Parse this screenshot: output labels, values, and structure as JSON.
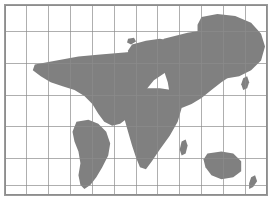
{
  "figure": {
    "width_px": 272,
    "height_px": 203
  },
  "chart_data": {
    "type": "map",
    "subtitle": "",
    "projection": "cylindrical",
    "xlabel": "Longitude",
    "ylabel": "Latitude",
    "xlim": [
      -180,
      180
    ],
    "ylim": [
      -60,
      84
    ],
    "grid": true,
    "legend_position": "none",
    "graticule": {
      "columns": 12,
      "rows": 6,
      "longitude_step_deg": 30,
      "latitude_step_deg": 24,
      "longitude_ticks": [
        -180,
        -150,
        -120,
        -90,
        -60,
        -30,
        0,
        30,
        60,
        90,
        120,
        150,
        180
      ],
      "latitude_ticks": [
        84,
        60,
        36,
        12,
        -12,
        -36,
        -60
      ]
    },
    "colors": {
      "land": "#808080",
      "ocean": "#ffffff",
      "graticule": "#8c8c8c",
      "border": "#9a9a9a",
      "background": "#ffffff"
    },
    "features": [
      "North America",
      "Greenland",
      "South America",
      "Europe",
      "Africa",
      "Asia",
      "Australia",
      "New Zealand",
      "Indonesia",
      "Japan",
      "British Isles",
      "Madagascar",
      "Iceland"
    ],
    "values": [],
    "categories": []
  },
  "map": {
    "land_color": "#808080",
    "ocean_color": "#ffffff",
    "grid_color": "#8c8c8c",
    "border_color": "#9a9a9a",
    "vertical_lines_x": [
      22,
      44,
      66,
      88,
      110,
      132,
      154,
      176,
      198,
      220,
      242
    ],
    "horizontal_lines_y": [
      27,
      59,
      91,
      123,
      155,
      182
    ],
    "landmasses": [
      {
        "name": "greenland",
        "path": "M 198 12 L 214 9 L 232 11 L 248 18 L 258 29 L 262 42 L 258 56 L 248 66 L 236 72 L 224 74 L 214 70 L 208 62 L 206 50 L 200 40 L 194 30 L 194 20 Z"
      },
      {
        "name": "north-america",
        "path": "M 30 60 L 52 56 L 74 52 L 96 50 L 120 48 L 142 46 L 160 44 L 176 42 L 186 46 L 184 56 L 174 62 L 162 68 L 150 76 L 142 86 L 138 96 L 132 106 L 124 114 L 116 120 L 108 122 L 100 118 L 94 110 L 88 100 L 80 92 L 70 86 L 58 82 L 46 78 L 36 72 L 28 66 Z"
      },
      {
        "name": "south-america",
        "path": "M 72 118 L 84 116 L 94 120 L 102 128 L 106 140 L 104 152 L 98 164 L 92 174 L 86 182 L 80 186 L 76 182 L 74 172 L 76 160 L 74 148 L 70 138 L 68 128 Z"
      },
      {
        "name": "europe",
        "path": "M 128 40 L 142 36 L 156 34 L 168 36 L 176 42 L 174 52 L 166 60 L 156 66 L 146 70 L 136 70 L 128 64 L 124 54 L 124 46 Z"
      },
      {
        "name": "africa",
        "path": "M 128 86 L 142 84 L 156 84 L 168 86 L 176 92 L 178 104 L 174 118 L 166 132 L 156 146 L 148 158 L 142 166 L 136 164 L 132 154 L 128 142 L 124 128 L 120 114 L 120 100 L 124 92 Z"
      },
      {
        "name": "asia",
        "path": "M 160 34 L 184 28 L 210 24 L 232 26 L 248 32 L 256 42 L 252 54 L 242 62 L 230 70 L 218 78 L 208 86 L 198 94 L 188 100 L 178 104 L 170 100 L 166 90 L 164 78 L 160 66 L 156 54 L 156 42 Z"
      },
      {
        "name": "australia",
        "path": "M 204 150 L 218 148 L 230 150 L 238 158 L 238 168 L 230 174 L 218 176 L 208 172 L 202 164 L 200 156 Z"
      },
      {
        "name": "new-zealand",
        "path": "M 248 174 L 252 172 L 254 178 L 250 184 L 246 186 L 246 180 Z"
      },
      {
        "name": "madagascar",
        "path": "M 178 138 L 182 136 L 184 142 L 182 150 L 178 152 L 176 146 Z"
      },
      {
        "name": "japan",
        "path": "M 240 74 L 244 72 L 246 78 L 244 84 L 240 86 L 238 80 Z"
      },
      {
        "name": "british-isles",
        "path": "M 126 52 L 132 50 L 134 56 L 130 60 L 126 58 Z"
      },
      {
        "name": "iceland",
        "path": "M 124 34 L 130 33 L 132 37 L 127 40 L 123 38 Z"
      }
    ]
  }
}
